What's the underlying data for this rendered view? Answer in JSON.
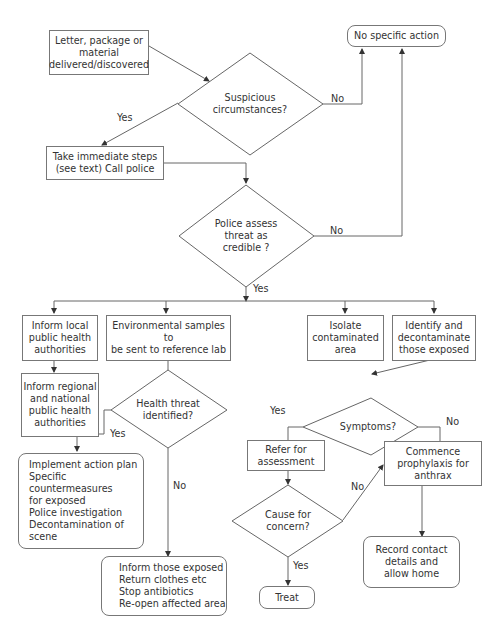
{
  "flowchart": {
    "nodes": {
      "start": "Letter, package or\nmaterial\ndelivered/discovered",
      "no_action": "No specific action",
      "suspicious": "Suspicious\ncircumstances?",
      "immediate_steps": "Take immediate steps\n(see text) Call police",
      "police_assess": "Police assess\nthreat as\ncredible ?",
      "inform_local": "Inform local\npublic health\nauthorities",
      "env_samples": "Environmental samples to\nbe sent to reference lab",
      "isolate": "Isolate\ncontaminated\narea",
      "identify": "Identify and\ndecontaminate\nthose exposed",
      "inform_regional": "Inform regional\nand national\npublic health\nauthorities",
      "health_threat": "Health threat\nidentified?",
      "symptoms": "Symptoms?",
      "action_plan": "Implement action plan\nSpecific countermeasures\n        for exposed\nPolice investigation\nDecontamination of scene",
      "refer": "Refer for\nassessment",
      "prophylaxis": "Commence\nprophylaxis for\nanthrax",
      "cause_concern": "Cause for\nconcern?",
      "inform_exposed": "Inform those exposed\nReturn clothes etc\nStop antibiotics\nRe-open affected area",
      "record_contact": "Record contact\ndetails and\nallow home",
      "treat": "Treat"
    },
    "edge_labels": {
      "suspicious_yes": "Yes",
      "suspicious_no": "No",
      "police_no": "No",
      "police_yes": "Yes",
      "health_yes": "Yes",
      "health_no": "No",
      "symptoms_yes": "Yes",
      "symptoms_no": "No",
      "cause_no": "No",
      "cause_yes": "Yes"
    },
    "line_color": "#666666"
  }
}
